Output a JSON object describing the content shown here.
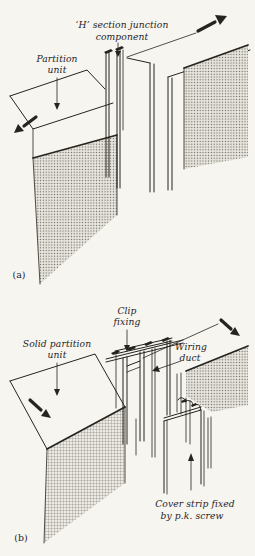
{
  "colors": {
    "bg": "#f7f5f0",
    "ink": "#26241f"
  },
  "diagram_a": {
    "tag": "(a)",
    "labels": {
      "h_section_line1": "‘H’ section junction",
      "h_section_line2": "component",
      "partition_line1": "Partition",
      "partition_line2": "unit"
    }
  },
  "diagram_b": {
    "tag": "(b)",
    "labels": {
      "clip_line1": "Clip",
      "clip_line2": "fixing",
      "solid_line1": "Solid partition",
      "solid_line2": "unit",
      "wiring_line1": "Wiring",
      "wiring_line2": "duct",
      "cover_line1": "Cover strip fixed",
      "cover_line2": "by p.k. screw"
    }
  }
}
